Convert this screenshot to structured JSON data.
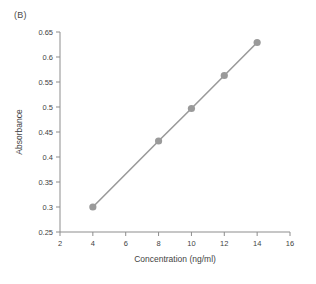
{
  "panel": {
    "label": "(B)"
  },
  "chart_data": {
    "type": "line",
    "title": "",
    "xlabel": "Concentration (ng/ml)",
    "ylabel": "Absorbance",
    "x": [
      4,
      8,
      10,
      12,
      14
    ],
    "values": [
      0.3,
      0.432,
      0.497,
      0.563,
      0.629
    ],
    "series": [
      {
        "name": "Standard curve",
        "x": [
          4,
          8,
          10,
          12,
          14
        ],
        "values": [
          0.3,
          0.432,
          0.497,
          0.563,
          0.629
        ]
      }
    ],
    "xlim": [
      2,
      16
    ],
    "ylim": [
      0.25,
      0.65
    ],
    "xticks": [
      2,
      4,
      6,
      8,
      10,
      12,
      14,
      16
    ],
    "xticklabels": [
      "2",
      "4",
      "6",
      "8",
      "10",
      "12",
      "14",
      "16"
    ],
    "yticks": [
      0.25,
      0.3,
      0.35,
      0.4,
      0.45,
      0.5,
      0.55,
      0.6,
      0.65
    ],
    "yticklabels": [
      "0.25",
      "0.3",
      "0.35",
      "0.4",
      "0.45",
      "0.5",
      "0.55",
      "0.6",
      "0.65"
    ],
    "grid": false,
    "legend": null,
    "marker": "circle",
    "colors": {
      "line": "#9a9a9a",
      "marker": "#9a9a9a",
      "axis": "#8d8d8d",
      "text": "#3f3f3f",
      "background": "#ffffff"
    }
  }
}
